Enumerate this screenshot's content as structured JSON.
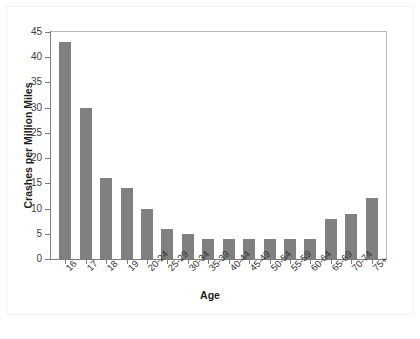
{
  "chart_data": {
    "type": "bar",
    "title": "",
    "xlabel": "Age",
    "ylabel": "Crashes per Million Miles",
    "categories": [
      "16",
      "17",
      "18",
      "19",
      "20-24",
      "25-29",
      "30-34",
      "35-39",
      "40-44",
      "45-49",
      "50-54",
      "55-59",
      "60-64",
      "65-69",
      "70-74",
      "75+"
    ],
    "values": [
      43,
      30,
      16,
      14,
      10,
      6,
      5,
      4,
      4,
      4,
      4,
      4,
      4,
      8,
      9,
      12
    ],
    "ylim": [
      0,
      45
    ],
    "ytick_values": [
      0,
      5,
      10,
      15,
      20,
      25,
      30,
      35,
      40,
      45
    ],
    "ytick_labels": [
      "0",
      "5",
      "10",
      "15",
      "20",
      "25",
      "30",
      "35",
      "40",
      "45"
    ],
    "grid": false,
    "legend": null,
    "bar_color": "#808080",
    "frame_color": "#b9b9b9",
    "axis_color": "#7d7d7d",
    "background": "#ffffff"
  }
}
